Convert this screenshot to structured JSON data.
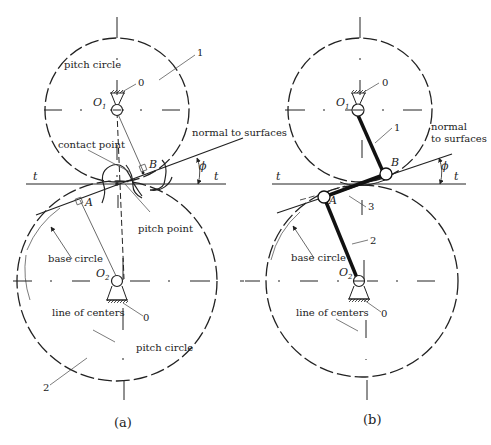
{
  "figure_a": {
    "caption": "(a)",
    "labels": {
      "pitch_circle_top": "pitch circle",
      "gear1": "1",
      "ground_top": "0",
      "center_top": "O",
      "center_top_sub": "1",
      "normal": "normal to surfaces",
      "contact_point": "contact point",
      "point_b": "B",
      "phi": "ϕ",
      "t_left": "t",
      "t_right": "t",
      "point_a": "A",
      "pitch_point": "pitch point",
      "base_circle": "base circle",
      "center_bottom": "O",
      "center_bottom_sub": "2",
      "line_of_centers": "line of centers",
      "ground_bottom": "0",
      "pitch_circle_bottom": "pitch circle",
      "gear2": "2"
    }
  },
  "figure_b": {
    "caption": "(b)",
    "labels": {
      "ground_top": "0",
      "center_top": "O",
      "center_top_sub": "1",
      "link1": "1",
      "normal_line1": "normal",
      "normal_line2": "to surfaces",
      "point_b": "B",
      "phi": "ϕ",
      "t_left": "t",
      "t_right": "t",
      "point_a": "A",
      "link3": "3",
      "link2": "2",
      "base_circle": "base circle",
      "center_bottom": "O",
      "center_bottom_sub": "2",
      "line_of_centers": "line of centers",
      "ground_bottom": "0"
    }
  }
}
